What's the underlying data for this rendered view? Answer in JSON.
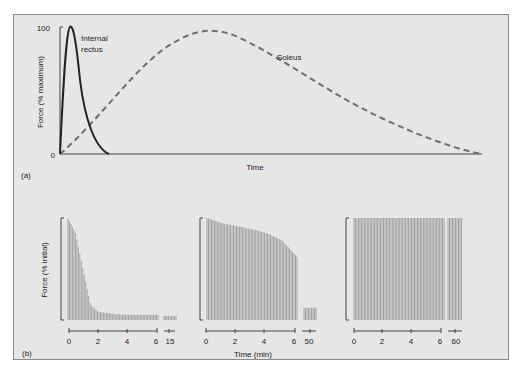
{
  "figure": {
    "panel_a_label": "(a)",
    "panel_b_label": "(b)"
  },
  "chart_data": [
    {
      "type": "line",
      "panel": "(a)",
      "title": "",
      "xlabel": "Time",
      "ylabel": "Force (% maximum)",
      "yticks": [
        "0",
        "100"
      ],
      "ylim": [
        0,
        100
      ],
      "series": [
        {
          "name": "Internal rectus",
          "style": "solid",
          "x": [
            0,
            0.04,
            0.08,
            0.12,
            0.16,
            0.2
          ],
          "values": [
            0,
            100,
            55,
            20,
            5,
            0
          ]
        },
        {
          "name": "Soleus",
          "style": "dashed",
          "x": [
            0,
            0.2,
            0.35,
            0.5,
            0.7,
            0.9,
            1.0
          ],
          "values": [
            0,
            55,
            100,
            85,
            50,
            12,
            0
          ]
        }
      ],
      "annotations": [
        "Internal rectus",
        "Soleus"
      ]
    },
    {
      "type": "bar",
      "panel": "(b)",
      "subplot": 1,
      "ylabel": "Force (% initial)",
      "xticks": [
        "0",
        "2",
        "4",
        "6",
        "15"
      ],
      "xlabel": "",
      "description": "Rapid fatigue: force falls to ~5% of initial by ~1.5 min",
      "x": [
        0,
        0.5,
        1,
        1.5,
        2,
        3,
        4,
        5,
        6,
        15
      ],
      "values": [
        100,
        85,
        50,
        15,
        8,
        6,
        5,
        5,
        5,
        4
      ]
    },
    {
      "type": "bar",
      "panel": "(b)",
      "subplot": 2,
      "xticks": [
        "0",
        "2",
        "4",
        "6",
        "50"
      ],
      "xlabel": "Time (min)",
      "description": "Intermediate fatigue: gradual decline then drop at ~6 min; low force at 50 min",
      "x": [
        0,
        1,
        2,
        3,
        4,
        5,
        6,
        50
      ],
      "values": [
        100,
        95,
        92,
        89,
        85,
        78,
        62,
        12
      ]
    },
    {
      "type": "bar",
      "panel": "(b)",
      "subplot": 3,
      "xticks": [
        "0",
        "2",
        "4",
        "6",
        "60"
      ],
      "xlabel": "",
      "description": "Fatigue resistant: force maintained at 100% through 60 min",
      "x": [
        0,
        2,
        4,
        6,
        60
      ],
      "values": [
        100,
        100,
        100,
        100,
        100
      ]
    }
  ],
  "labels": {
    "a_y100": "100",
    "a_y0": "0",
    "a_xlabel": "Time",
    "a_ylabel": "Force (% maximum)",
    "a_series1": "Internal",
    "a_series1b": "rectus",
    "a_series2": "Soleus",
    "b_ylabel": "Force (% initial)",
    "b_xlabel": "Time (min)",
    "b1_ticks": [
      "0",
      "2",
      "4",
      "6",
      "15"
    ],
    "b2_ticks": [
      "0",
      "2",
      "4",
      "6",
      "50"
    ],
    "b3_ticks": [
      "0",
      "2",
      "4",
      "6",
      "60"
    ]
  },
  "colors": {
    "background": "#e6e6e6",
    "line": "#222222",
    "dashed": "#6e6e6e",
    "bars": "#9a9a9a"
  }
}
